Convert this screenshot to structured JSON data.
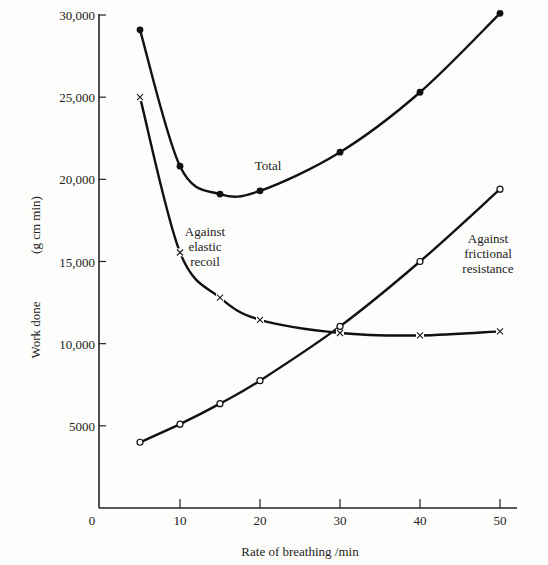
{
  "chart_data": {
    "type": "line",
    "title": "",
    "xlabel": "Rate of breathing /min",
    "ylabel": "Work done",
    "ylabel_units": "(g cm min)",
    "xlim": [
      0,
      52
    ],
    "ylim": [
      0,
      30000
    ],
    "grid": false,
    "legend": "inline annotations",
    "x_ticks": [
      0,
      10,
      20,
      30,
      40,
      50
    ],
    "x_tick_labels": [
      "0",
      "10",
      "20",
      "30",
      "40",
      "50"
    ],
    "y_ticks": [
      5000,
      10000,
      15000,
      20000,
      25000,
      30000
    ],
    "y_tick_labels": [
      "5000",
      "10,000",
      "15,000",
      "20,000",
      "25,000",
      "30,000"
    ],
    "x": [
      5,
      10,
      15,
      20,
      30,
      40,
      50
    ],
    "series": [
      {
        "name": "Total",
        "marker": "filled-circle",
        "label_lines": [
          "Total"
        ],
        "values": [
          29100,
          20800,
          19100,
          19300,
          21650,
          25300,
          30100
        ]
      },
      {
        "name": "Against elastic recoil",
        "marker": "cross",
        "label_lines": [
          "Against",
          "elastic",
          "recoil"
        ],
        "values": [
          25000,
          15550,
          12800,
          11450,
          10650,
          10500,
          10750
        ]
      },
      {
        "name": "Against frictional resistance",
        "marker": "open-circle",
        "label_lines": [
          "Against",
          "frictional",
          "resistance"
        ],
        "values": [
          4000,
          5100,
          6350,
          7750,
          11050,
          15000,
          19400
        ]
      }
    ]
  }
}
